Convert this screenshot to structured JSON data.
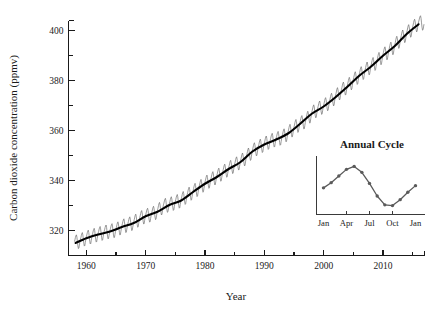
{
  "chart_data": {
    "type": "line",
    "title": "",
    "xlabel": "Year",
    "ylabel": "Carbon dioxide concentration (ppmv)",
    "xlim": [
      1957,
      2017
    ],
    "ylim": [
      310,
      404
    ],
    "grid": false,
    "legend": "none",
    "x_ticks_major": [
      "1960",
      "1970",
      "1980",
      "1990",
      "2000",
      "2010"
    ],
    "x_ticks_major_values": [
      1960,
      1970,
      1980,
      1990,
      2000,
      2010
    ],
    "x_ticks_minor_values": [
      1965,
      1975,
      1985,
      1995,
      2005,
      2015
    ],
    "y_ticks_major": [
      "320",
      "340",
      "360",
      "380",
      "400"
    ],
    "y_ticks_major_values": [
      320,
      340,
      360,
      380,
      400
    ],
    "y_ticks_minor_values": [
      330,
      350,
      370,
      390
    ],
    "series": [
      {
        "name": "Monthly mean CO2 (seasonal sawtooth)",
        "style": "thin-gray-line",
        "x": [
          1958.2,
          1959,
          1960,
          1961,
          1962,
          1963,
          1964,
          1965,
          1966,
          1967,
          1968,
          1969,
          1970,
          1971,
          1972,
          1973,
          1974,
          1975,
          1976,
          1977,
          1978,
          1979,
          1980,
          1981,
          1982,
          1983,
          1984,
          1985,
          1986,
          1987,
          1988,
          1989,
          1990,
          1991,
          1992,
          1993,
          1994,
          1995,
          1996,
          1997,
          1998,
          1999,
          2000,
          2001,
          2002,
          2003,
          2004,
          2005,
          2006,
          2007,
          2008,
          2009,
          2010,
          2011,
          2012,
          2013,
          2014,
          2015,
          2016
        ],
        "annual_mean": [
          315.0,
          315.8,
          316.9,
          317.6,
          318.4,
          319.0,
          319.6,
          320.0,
          321.4,
          322.2,
          323.0,
          324.6,
          325.7,
          326.3,
          327.5,
          329.7,
          330.2,
          331.1,
          332.0,
          333.8,
          335.4,
          336.8,
          338.7,
          340.1,
          341.4,
          343.0,
          344.6,
          346.0,
          347.4,
          349.2,
          351.6,
          353.1,
          354.4,
          355.6,
          356.4,
          357.1,
          358.8,
          360.8,
          362.6,
          363.7,
          366.7,
          368.4,
          369.6,
          371.2,
          373.3,
          375.8,
          377.5,
          379.8,
          381.9,
          383.8,
          385.6,
          387.4,
          389.9,
          391.6,
          393.8,
          396.5,
          398.6,
          400.8,
          402.9
        ],
        "seasonal_amplitude_ppmv": 6.0,
        "seasonal_peak_month": "May",
        "seasonal_trough_month": "September"
      },
      {
        "name": "Smoothed trend",
        "style": "thick-black-line",
        "x": [
          1958.2,
          1960,
          1962,
          1964,
          1966,
          1968,
          1970,
          1972,
          1974,
          1976,
          1978,
          1980,
          1982,
          1984,
          1986,
          1988,
          1990,
          1992,
          1994,
          1996,
          1998,
          2000,
          2002,
          2004,
          2006,
          2008,
          2010,
          2012,
          2014,
          2016
        ],
        "y": [
          315.0,
          316.9,
          318.4,
          319.6,
          321.4,
          323.0,
          325.7,
          327.5,
          330.2,
          332.0,
          335.4,
          338.7,
          341.4,
          344.6,
          347.4,
          351.6,
          354.4,
          356.4,
          358.8,
          362.6,
          366.7,
          369.6,
          373.3,
          377.5,
          381.9,
          385.6,
          389.9,
          393.8,
          398.6,
          402.5
        ]
      }
    ]
  },
  "inset_chart": {
    "type": "line",
    "title": "Annual Cycle",
    "xlabel": "",
    "ylabel": "",
    "grid": false,
    "legend": "none",
    "x_tick_labels": [
      "Jan",
      "Apr",
      "Jul",
      "Oct",
      "Jan"
    ],
    "categories": [
      "Jan",
      "Feb",
      "Mar",
      "Apr",
      "May",
      "Jun",
      "Jul",
      "Aug",
      "Sep",
      "Oct",
      "Nov",
      "Dec",
      "Jan"
    ],
    "values": [
      2.1,
      2.8,
      3.7,
      4.6,
      5.0,
      4.2,
      2.7,
      1.0,
      -0.2,
      -0.3,
      0.5,
      1.5,
      2.4
    ],
    "units": "ppmv deviation from annual mean"
  },
  "axis": {
    "y_title": "Carbon dioxide concentration (ppmv)",
    "x_title": "Year"
  }
}
